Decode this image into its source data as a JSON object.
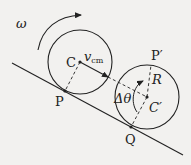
{
  "diagram": {
    "type": "rolling-wheel-on-incline",
    "colors": {
      "background": "#f2f1ef",
      "ink": "#222222"
    },
    "labels": {
      "omega": "ω",
      "center_initial": "C",
      "velocity": "v",
      "velocity_subscript": "cm",
      "contact_initial": "P",
      "point_top_final": "P′",
      "point_R": "R",
      "center_final": "C",
      "center_final_prime": "′",
      "contact_final": "Q",
      "angle": "Δθ"
    },
    "elements": {
      "incline": "straight line sloping down to the right",
      "wheel_initial": "circle centered at C touching incline at P",
      "wheel_final": "circle centered at C′ touching incline at Q",
      "omega_arrow": "curved clockwise arrow above initial wheel",
      "velocity_arrow": "arrow from C parallel to incline",
      "dashed_radius_initial": "dashed line C to P",
      "dashed_lines_final": "dashed lines C′ to Q, C′ to P′, C′ to R",
      "angle_arc": "arc with arrow marking Δθ at C′"
    }
  }
}
